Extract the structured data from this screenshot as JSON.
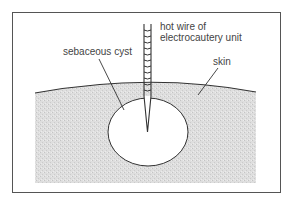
{
  "figure": {
    "labels": {
      "wire_line1": "hot wire of",
      "wire_line2": "electrocautery unit",
      "cyst": "sebaceous cyst",
      "skin": "skin"
    },
    "colors": {
      "frame": "#555555",
      "line": "#333333",
      "skin_fill": "#d9d9d9",
      "cyst_fill": "#ffffff",
      "text": "#444444"
    }
  }
}
